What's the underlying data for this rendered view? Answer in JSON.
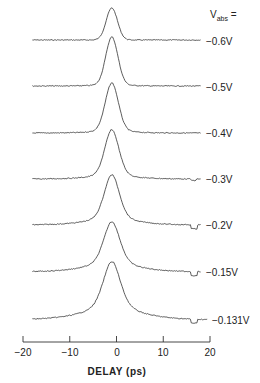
{
  "chart_data": {
    "type": "line",
    "title": "",
    "xlabel": "DELAY (ps)",
    "ylabel": "",
    "xlim": [
      -20,
      20
    ],
    "xticks": [
      -20,
      -10,
      0,
      10,
      20
    ],
    "xtick_labels": [
      "−20",
      "−10",
      "0",
      "10",
      "20"
    ],
    "grid": false,
    "legend_header": "V_abs =",
    "legend_position": "right, per-trace labels",
    "peak_delay_ps": -1,
    "series": [
      {
        "name": "-0.6V",
        "label": "−0.6V",
        "baseline_y": 40,
        "peak_y": 8,
        "width_ps": 1.2,
        "tail": 0.0,
        "dip": false
      },
      {
        "name": "-0.5V",
        "label": "−0.5V",
        "baseline_y": 86,
        "peak_y": 37,
        "width_ps": 1.3,
        "tail": 0.1,
        "dip": false
      },
      {
        "name": "-0.4V",
        "label": "−0.4V",
        "baseline_y": 133,
        "peak_y": 83,
        "width_ps": 1.4,
        "tail": 0.2,
        "dip": false
      },
      {
        "name": "-0.3V",
        "label": "−0.3V",
        "baseline_y": 179,
        "peak_y": 130,
        "width_ps": 1.5,
        "tail": 0.35,
        "dip": "small"
      },
      {
        "name": "-0.2V",
        "label": "−0.2V",
        "baseline_y": 225,
        "peak_y": 175,
        "width_ps": 1.6,
        "tail": 0.55,
        "dip": true
      },
      {
        "name": "-0.15V",
        "label": "−0.15V",
        "baseline_y": 272,
        "peak_y": 222,
        "width_ps": 1.7,
        "tail": 0.7,
        "dip": true
      },
      {
        "name": "-0.131V",
        "label": "−0.131V",
        "baseline_y": 320,
        "peak_y": 262,
        "width_ps": 1.8,
        "tail": 0.85,
        "dip": true
      }
    ]
  },
  "axis": {
    "xlabel": "DELAY (ps)",
    "ticks": [
      "−20",
      "−10",
      "0",
      "10",
      "20"
    ]
  },
  "legend": {
    "header_main": "V",
    "header_sub": "abs",
    "header_suffix": " ="
  },
  "labels": [
    "−0.6V",
    "−0.5V",
    "−0.4V",
    "−0.3V",
    "−0.2V",
    "−0.15V",
    "−0.131V"
  ]
}
